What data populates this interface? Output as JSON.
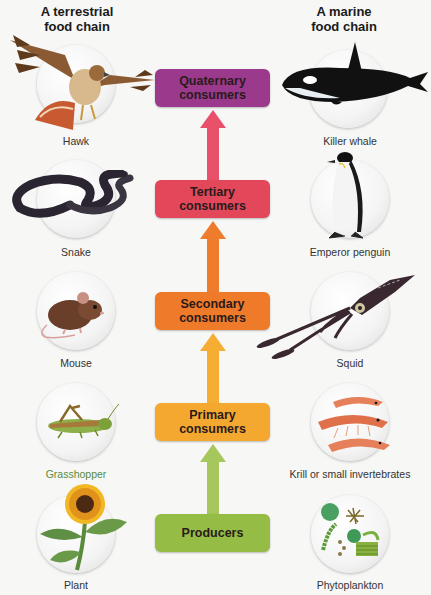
{
  "titles": {
    "terrestrial": "A terrestrial food chain",
    "terrestrial_line1": "A terrestrial",
    "terrestrial_line2": "food chain",
    "marine": "A marine food chain",
    "marine_line1": "A marine",
    "marine_line2": "food chain"
  },
  "levels": [
    {
      "line1": "Quaternary",
      "line2": "consumers",
      "color": "#9b3a8c"
    },
    {
      "line1": "Tertiary",
      "line2": "consumers",
      "color": "#e2485a"
    },
    {
      "line1": "Secondary",
      "line2": "consumers",
      "color": "#ef7a2a"
    },
    {
      "line1": "Primary",
      "line2": "consumers",
      "color": "#f5a830"
    },
    {
      "line1": "Producers",
      "line2": "",
      "color": "#95bd45"
    }
  ],
  "terrestrial": [
    {
      "name": "Hawk",
      "icon": "hawk-icon"
    },
    {
      "name": "Snake",
      "icon": "snake-icon"
    },
    {
      "name": "Mouse",
      "icon": "mouse-icon"
    },
    {
      "name": "Grasshopper",
      "icon": "grasshopper-icon"
    },
    {
      "name": "Plant",
      "icon": "sunflower-icon"
    }
  ],
  "marine": [
    {
      "name": "Killer whale",
      "icon": "killer-whale-icon"
    },
    {
      "name": "Emperor penguin",
      "icon": "penguin-icon"
    },
    {
      "name": "Squid",
      "icon": "squid-icon"
    },
    {
      "name": "Krill or small invertebrates",
      "icon": "krill-icon"
    },
    {
      "name": "Phytoplankton",
      "icon": "phytoplankton-icon"
    }
  ],
  "arrow_colors": [
    "#e9506a",
    "#ef7c2c",
    "#f5ad34",
    "#a6c75b"
  ]
}
